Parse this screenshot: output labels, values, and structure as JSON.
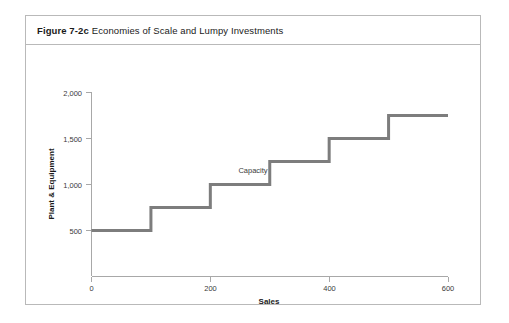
{
  "figure": {
    "caption_bold": "Figure 7-2c",
    "caption_rest": "Economies of Scale and Lumpy Investments"
  },
  "chart_data": {
    "type": "line",
    "style": "step",
    "title": "Economies of Scale and Lumpy Investments",
    "xlabel": "Sales",
    "ylabel": "Plant & Equipment",
    "xlim": [
      0,
      600
    ],
    "ylim": [
      0,
      2000
    ],
    "grid": false,
    "legend": false,
    "xticks": [
      0,
      200,
      400,
      600
    ],
    "xtick_labels": [
      "0",
      "200",
      "400",
      "600"
    ],
    "yticks": [
      500,
      1000,
      1500,
      2000
    ],
    "ytick_labels": [
      "500",
      "1,000",
      "1,500",
      "2,000"
    ],
    "line_color": "#7d7d7d",
    "axis_color": "#a8a8a8",
    "x": [
      0,
      100,
      100,
      200,
      200,
      300,
      300,
      400,
      400,
      500,
      500,
      600
    ],
    "y": [
      500,
      500,
      750,
      750,
      1000,
      1000,
      1250,
      1250,
      1500,
      1500,
      1750,
      1750
    ],
    "steps": [
      {
        "x_start": 0,
        "x_end": 100,
        "level": 500
      },
      {
        "x_start": 100,
        "x_end": 200,
        "level": 750
      },
      {
        "x_start": 200,
        "x_end": 300,
        "level": 1000
      },
      {
        "x_start": 300,
        "x_end": 400,
        "level": 1250
      },
      {
        "x_start": 400,
        "x_end": 500,
        "level": 1500
      },
      {
        "x_start": 500,
        "x_end": 600,
        "level": 1750
      }
    ],
    "annotations": [
      {
        "text": "Capacity",
        "x": 300,
        "y": 1250,
        "label": "capacity-annotation"
      }
    ]
  }
}
